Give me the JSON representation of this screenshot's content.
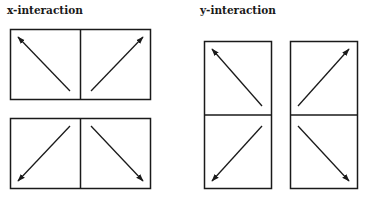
{
  "diagram": {
    "x_interaction": {
      "label": "x-interaction",
      "layout": "two panels side by side, stacked twice",
      "top_row": [
        {
          "panel": "left",
          "arrow": "up-left"
        },
        {
          "panel": "right",
          "arrow": "up-right"
        }
      ],
      "bottom_row": [
        {
          "panel": "left",
          "arrow": "down-left"
        },
        {
          "panel": "right",
          "arrow": "down-right"
        }
      ]
    },
    "y_interaction": {
      "label": "y-interaction",
      "layout": "two panels stacked vertically, repeated side by side",
      "left_column": [
        {
          "panel": "top",
          "arrow": "up-left"
        },
        {
          "panel": "bottom",
          "arrow": "down-left"
        }
      ],
      "right_column": [
        {
          "panel": "top",
          "arrow": "up-right"
        },
        {
          "panel": "bottom",
          "arrow": "down-right"
        }
      ]
    },
    "colors": {
      "stroke": "#1a1a1a",
      "background": "#ffffff"
    }
  }
}
